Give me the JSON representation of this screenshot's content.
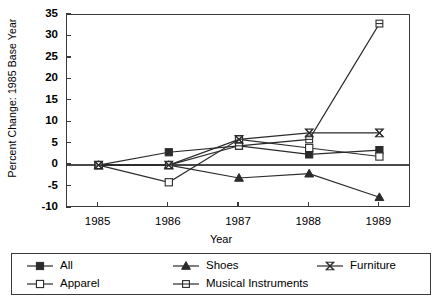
{
  "chart_data": {
    "type": "line",
    "title": "",
    "xlabel": "Year",
    "ylabel": "Percent Change: 1985 Base Year",
    "categories": [
      "1985",
      "1986",
      "1987",
      "1988",
      "1989"
    ],
    "x": [
      1985,
      1986,
      1987,
      1988,
      1989
    ],
    "xlim": [
      1984.55,
      1989.45
    ],
    "ylim": [
      -10,
      35
    ],
    "yticks": [
      35,
      30,
      25,
      20,
      15,
      10,
      5,
      0,
      -5,
      -10
    ],
    "ytick_labels": [
      "35",
      "30",
      "25",
      "20",
      "15",
      "10",
      "5",
      "0",
      "-5",
      "-10"
    ],
    "grid": false,
    "legend_position": "bottom",
    "zero_line": true,
    "series": [
      {
        "name": "All",
        "marker": "filled-square",
        "values": [
          0,
          3,
          4.5,
          2.5,
          3.5
        ]
      },
      {
        "name": "Apparel",
        "marker": "open-square",
        "values": [
          0,
          -4,
          6,
          4,
          2
        ]
      },
      {
        "name": "Shoes",
        "marker": "filled-triangle",
        "values": [
          0,
          0,
          -3,
          -2,
          -7.5
        ]
      },
      {
        "name": "Musical Instruments",
        "marker": "open-square-dash",
        "values": [
          0,
          0,
          4.5,
          6,
          33
        ]
      },
      {
        "name": "Furniture",
        "marker": "hourglass-x",
        "values": [
          0,
          0,
          6,
          7.5,
          7.5
        ]
      }
    ]
  },
  "legend": {
    "entries": [
      {
        "label": "All",
        "marker": "filled-square"
      },
      {
        "label": "Shoes",
        "marker": "filled-triangle"
      },
      {
        "label": "Furniture",
        "marker": "hourglass-x"
      },
      {
        "label": "Apparel",
        "marker": "open-square"
      },
      {
        "label": "Musical Instruments",
        "marker": "open-square-dash"
      }
    ]
  },
  "colors": {
    "line": "#2b2b2b",
    "axis": "#3a3a3a",
    "background": "#ffffff"
  }
}
